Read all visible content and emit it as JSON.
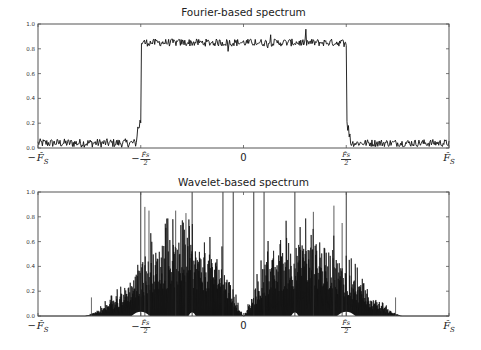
{
  "chart_data": [
    {
      "type": "line",
      "title": "Fourier-based spectrum",
      "xlabel": "",
      "ylabel": "",
      "xlim": [
        -1,
        1
      ],
      "ylim": [
        0,
        1.0
      ],
      "grid": false,
      "legend": null,
      "x_ticks": [
        {
          "pos": -1.0,
          "label": "−F̂_S",
          "num": "",
          "den": "",
          "neg": true,
          "text": "F̂",
          "sub": "S"
        },
        {
          "pos": -0.5,
          "label": "−F̂_S/2",
          "neg": true,
          "num": "F̂s",
          "den": "2"
        },
        {
          "pos": 0.0,
          "label": "0",
          "plain": true
        },
        {
          "pos": 0.5,
          "label": "F̂_S/2",
          "neg": false,
          "num": "F̂s",
          "den": "2"
        },
        {
          "pos": 1.0,
          "label": "F̂_S",
          "neg": false,
          "text": "F̂",
          "sub": "S"
        }
      ],
      "y_ticks": [
        "0.0",
        "0.2",
        "0.4",
        "0.6",
        "0.8",
        "1.0"
      ],
      "description": "Ideal band-pass: ~0.85 inside [-Fs/2, Fs/2] with noise, ~0.05 noise floor outside, sharp transitions with a small ramp near edges",
      "segments": [
        {
          "x_from": -1.0,
          "x_to": -0.52,
          "level": 0.04,
          "noise": 0.035
        },
        {
          "x_from": -0.52,
          "x_to": -0.5,
          "level": 0.12,
          "noise": 0.06,
          "ramp_to": 0.22
        },
        {
          "x_from": -0.5,
          "x_to": 0.5,
          "level": 0.85,
          "noise": 0.03
        },
        {
          "x_from": 0.5,
          "x_to": 0.52,
          "level": 0.2,
          "noise": 0.05,
          "ramp_to": 0.1
        },
        {
          "x_from": 0.52,
          "x_to": 1.0,
          "level": 0.04,
          "noise": 0.03
        }
      ]
    },
    {
      "type": "line",
      "title": "Wavelet-based spectrum",
      "xlabel": "",
      "ylabel": "",
      "xlim": [
        -1,
        1
      ],
      "ylim": [
        0,
        1.0
      ],
      "grid": false,
      "legend": null,
      "x_ticks": [
        {
          "pos": -1.0,
          "label": "−F̂_S",
          "neg": true,
          "text": "F̂",
          "sub": "S"
        },
        {
          "pos": -0.5,
          "label": "−F̂_S/2",
          "neg": true,
          "num": "F̂s",
          "den": "2"
        },
        {
          "pos": 0.0,
          "label": "0",
          "plain": true
        },
        {
          "pos": 0.5,
          "label": "F̂_S/2",
          "neg": false,
          "num": "F̂s",
          "den": "2"
        },
        {
          "pos": 1.0,
          "label": "F̂_S",
          "neg": false,
          "text": "F̂",
          "sub": "S"
        }
      ],
      "y_ticks": [
        "0.0",
        "0.2",
        "0.4",
        "0.6",
        "0.8",
        "1.0"
      ],
      "description": "Dense spiky spectrum, symmetric about 0, envelope rising from ~-0.75 to peak ~0.5 near ±0.4, falling to 0 near ±0.78; gap near 0; isolated spikes reaching 1.0",
      "envelope": [
        [
          -1.0,
          0.0
        ],
        [
          -0.77,
          0.0
        ],
        [
          -0.72,
          0.03
        ],
        [
          -0.62,
          0.12
        ],
        [
          -0.52,
          0.3
        ],
        [
          -0.42,
          0.45
        ],
        [
          -0.3,
          0.5
        ],
        [
          -0.2,
          0.45
        ],
        [
          -0.1,
          0.35
        ],
        [
          -0.03,
          0.08
        ],
        [
          0.0,
          0.0
        ],
        [
          0.03,
          0.08
        ],
        [
          0.1,
          0.35
        ],
        [
          0.2,
          0.45
        ],
        [
          0.3,
          0.5
        ],
        [
          0.42,
          0.45
        ],
        [
          0.52,
          0.3
        ],
        [
          0.62,
          0.12
        ],
        [
          0.72,
          0.03
        ],
        [
          0.77,
          0.0
        ],
        [
          1.0,
          0.0
        ]
      ],
      "full_spikes_x": [
        -0.5,
        -0.25,
        -0.1,
        -0.05,
        0.05,
        0.1,
        0.25,
        0.5
      ],
      "isolated_spikes": [
        {
          "x": -0.74,
          "y": 0.15
        },
        {
          "x": 0.74,
          "y": 0.15
        }
      ],
      "tall_spikes": [
        {
          "x": -0.48,
          "y": 0.88
        },
        {
          "x": -0.46,
          "y": 0.85
        },
        {
          "x": -0.33,
          "y": 0.85
        },
        {
          "x": -0.28,
          "y": 0.83
        },
        {
          "x": 0.34,
          "y": 0.84
        },
        {
          "x": 0.44,
          "y": 0.89
        },
        {
          "x": 0.48,
          "y": 0.75
        }
      ]
    }
  ],
  "layout": {
    "axes": [
      {
        "left": 38,
        "top": 24,
        "right": 449,
        "bottom": 148,
        "title_y": 6
      },
      {
        "left": 38,
        "top": 192,
        "right": 449,
        "bottom": 316,
        "title_y": 176
      }
    ],
    "line_color": "#111111",
    "axis_color": "#555555"
  }
}
